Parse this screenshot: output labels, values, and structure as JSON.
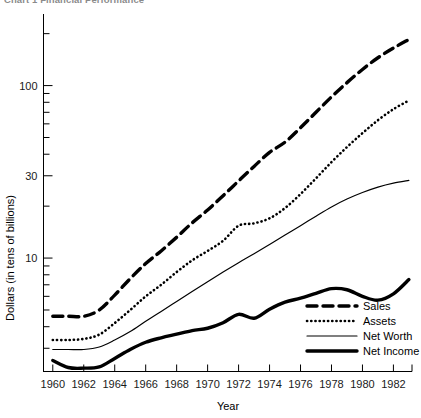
{
  "title_clipped": "Chart 1  Financial Performance",
  "chart_data": {
    "type": "line",
    "title": "Chart 1  Financial Performance",
    "xlabel": "Year",
    "ylabel": "Dollars (in tens of billions)",
    "yscale": "log",
    "ylim": [
      2.2,
      260
    ],
    "xlim": [
      1959.4,
      1983.2
    ],
    "grid": false,
    "legend_position": "lower-right",
    "x_tick_labels": [
      "1960",
      "1962",
      "1964",
      "1966",
      "1968",
      "1970",
      "1972",
      "1974",
      "1976",
      "1978",
      "1980",
      "1982"
    ],
    "x_ticks": [
      1960,
      1962,
      1964,
      1966,
      1968,
      1970,
      1972,
      1974,
      1976,
      1978,
      1980,
      1982
    ],
    "y_tick_labels": [
      "100",
      "30",
      "10"
    ],
    "y_ticks_major": [
      100,
      30,
      10
    ],
    "y_ticks_minor": [
      200,
      90,
      80,
      70,
      60,
      50,
      40,
      20,
      9,
      8,
      7,
      6,
      5,
      4,
      3
    ],
    "x": [
      1960,
      1961,
      1962,
      1963,
      1964,
      1965,
      1966,
      1967,
      1968,
      1969,
      1970,
      1971,
      1972,
      1973,
      1974,
      1975,
      1976,
      1977,
      1978,
      1979,
      1980,
      1981,
      1982,
      1983
    ],
    "series": [
      {
        "name": "Sales",
        "style": "thick-dashed",
        "values": [
          4.6,
          4.6,
          4.6,
          5.0,
          6.1,
          7.6,
          9.3,
          11.0,
          13.2,
          16.0,
          19.0,
          23.0,
          28.0,
          34.0,
          41.0,
          47.0,
          57.0,
          70.0,
          86.0,
          104.0,
          124.0,
          145.0,
          165.0,
          185.0
        ]
      },
      {
        "name": "Assets",
        "style": "dotted",
        "values": [
          3.35,
          3.35,
          3.4,
          3.6,
          4.2,
          5.0,
          6.0,
          7.0,
          8.3,
          9.7,
          11.0,
          12.6,
          15.4,
          15.9,
          17.0,
          19.5,
          23.5,
          29.0,
          36.0,
          44.0,
          53.0,
          63.0,
          73.0,
          82.0
        ]
      },
      {
        "name": "Net Worth",
        "style": "thin-solid",
        "values": [
          2.95,
          2.95,
          2.95,
          3.05,
          3.35,
          3.75,
          4.3,
          4.9,
          5.6,
          6.4,
          7.3,
          8.3,
          9.4,
          10.6,
          12.0,
          13.6,
          15.4,
          17.5,
          19.8,
          22.0,
          24.0,
          25.8,
          27.2,
          28.2
        ]
      },
      {
        "name": "Net Income",
        "style": "thick-solid",
        "values": [
          2.55,
          2.32,
          2.3,
          2.34,
          2.62,
          2.95,
          3.25,
          3.45,
          3.62,
          3.8,
          3.92,
          4.22,
          4.72,
          4.48,
          5.05,
          5.55,
          5.85,
          6.25,
          6.65,
          6.55,
          6.0,
          5.7,
          6.2,
          7.5
        ]
      }
    ],
    "legend": [
      {
        "label": "Sales",
        "style": "thick-dashed"
      },
      {
        "label": "Assets",
        "style": "dotted"
      },
      {
        "label": "Net Worth",
        "style": "thin-solid"
      },
      {
        "label": "Net Income",
        "style": "thick-solid"
      }
    ]
  }
}
